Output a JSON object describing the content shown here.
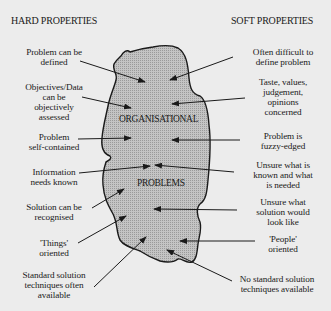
{
  "colors": {
    "background": "#ececec",
    "blob_fill": "#bdbdbd",
    "outline": "#1a1a1a",
    "text": "#1a1a1a"
  },
  "headings": {
    "left": "HARD PROPERTIES",
    "right": "SOFT PROPERTIES"
  },
  "center": {
    "top_word": "ORGANISATIONAL",
    "bottom_word": "PROBLEMS"
  },
  "hard_properties": [
    {
      "text": "Problem can be\ndefined"
    },
    {
      "text": "Objectives/Data\ncan be\nobjectively\nassessed"
    },
    {
      "text": "Problem\nself-contained"
    },
    {
      "text": "Information\nneeds known"
    },
    {
      "text": "Solution can be\nrecognised"
    },
    {
      "text": "'Things'\noriented"
    },
    {
      "text": "Standard solution\ntechniques often\navailable"
    }
  ],
  "soft_properties": [
    {
      "text": "Often difficult to\ndefine problem"
    },
    {
      "text": "Taste, values,\njudgement,\nopinions\nconcerned"
    },
    {
      "text": "Problem is\nfuzzy-edged"
    },
    {
      "text": "Unsure what is\nknown and what\nis needed"
    },
    {
      "text": "Unsure what\nsolution would\nlook like"
    },
    {
      "text": "'People'\noriented"
    },
    {
      "text": "No standard solution\ntechniques available"
    }
  ]
}
